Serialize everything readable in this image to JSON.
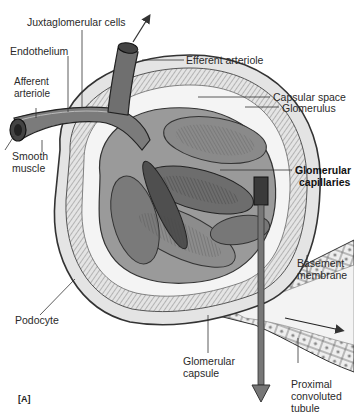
{
  "figure": {
    "panel_label": "[A]",
    "style": "grayscale pen-and-ink anatomical illustration"
  },
  "labels": {
    "juxtaglomerular_cells": "Juxtaglomerular cells",
    "endothelium": "Endothelium",
    "afferent_arteriole_l1": "Afferent",
    "afferent_arteriole_l2": "arteriole",
    "efferent_arteriole": "Efferent arteriole",
    "capsular_space": "Capsular space",
    "glomerulus": "Glomerulus",
    "smooth_muscle_l1": "Smooth",
    "smooth_muscle_l2": "muscle",
    "glomerular_capillaries_l1": "Glomerular",
    "glomerular_capillaries_l2": "capillaries",
    "basement_membrane_l1": "Basement",
    "basement_membrane_l2": "membrane",
    "podocyte": "Podocyte",
    "glomerular_capsule_l1": "Glomerular",
    "glomerular_capsule_l2": "capsule",
    "proximal_tubule_l1": "Proximal",
    "proximal_tubule_l2": "convoluted",
    "proximal_tubule_l3": "tubule"
  },
  "colors": {
    "background": "#ffffff",
    "ink": "#2a2a2a",
    "capsule_fill": "#d9d9d9",
    "capillary_fill": "#8f8f8f",
    "capillary_dark": "#555555",
    "tubule_fill": "#e6e6e6"
  }
}
